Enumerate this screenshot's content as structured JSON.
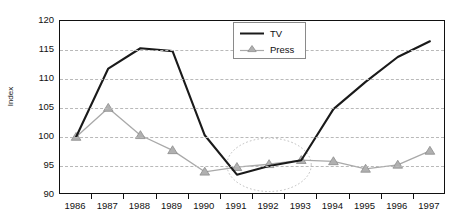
{
  "chart_data": {
    "type": "line",
    "title": "",
    "xlabel": "",
    "ylabel": "Index",
    "categories": [
      "1986",
      "1987",
      "1988",
      "1989",
      "1990",
      "1991",
      "1992",
      "1993",
      "1994",
      "1995",
      "1996",
      "1997"
    ],
    "ylim": [
      90,
      120
    ],
    "y_ticks": [
      90,
      95,
      100,
      105,
      110,
      115,
      120
    ],
    "grid": "horizontal-dashed",
    "legend_position": "top-center",
    "series": [
      {
        "name": "TV",
        "color": "#1a1a1a",
        "marker": "none",
        "values": [
          100,
          111.8,
          115.3,
          114.8,
          100.3,
          93.5,
          95.0,
          96.0,
          104.8,
          109.5,
          113.8,
          116.5
        ]
      },
      {
        "name": "Press",
        "color": "#a9a9a9",
        "marker": "triangle",
        "values": [
          100,
          105.0,
          100.3,
          97.7,
          94.0,
          94.8,
          95.3,
          96.0,
          95.8,
          94.5,
          95.2,
          97.6
        ]
      }
    ],
    "annotations": [
      {
        "type": "ellipse",
        "name": "convergence-highlight",
        "style": "dotted",
        "color": "#bdbdbd",
        "x_center_category": "1992",
        "x_span_categories": [
          "1991",
          "1993"
        ],
        "y_center": 95.2,
        "y_radius": 4.6
      }
    ]
  },
  "axis": {
    "y_title": "Index",
    "y_tick_labels": [
      "120",
      "115",
      "110",
      "105",
      "100",
      "95",
      "90"
    ],
    "x_tick_labels": [
      "1986",
      "1987",
      "1988",
      "1989",
      "1990",
      "1991",
      "1992",
      "1993",
      "1994",
      "1995",
      "1996",
      "1997"
    ]
  },
  "legend": {
    "items": [
      {
        "label": "TV",
        "swatch": "solid-line-dark"
      },
      {
        "label": "Press",
        "swatch": "line-with-triangle-marker"
      }
    ]
  },
  "colors": {
    "tv_line": "#1a1a1a",
    "press_line": "#a9a9a9",
    "press_marker_fill": "#b0b0b0",
    "press_marker_stroke": "#8d8d8d",
    "gridline": "#b9b9b9",
    "frame": "#111111",
    "annotation_ellipse": "#bdbdbd",
    "background": "#ffffff"
  }
}
